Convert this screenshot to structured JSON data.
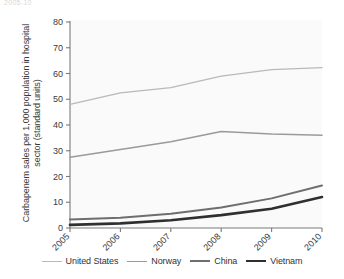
{
  "figure": {
    "top_caption": "2005-10",
    "background_color": "#ffffff",
    "plot_background_color": "#fafafa"
  },
  "chart_data": {
    "type": "line",
    "title": "",
    "subtitle": "",
    "xlabel": "",
    "ylabel": "Carbapenem sales per 1,000 population in hospital sector (standard units)",
    "categories": [
      "2005",
      "2006",
      "2007",
      "2008",
      "2009",
      "2010"
    ],
    "x": [
      2005,
      2006,
      2007,
      2008,
      2009,
      2010
    ],
    "xlim": [
      2005,
      2010
    ],
    "ylim": [
      0,
      80
    ],
    "yticks": [
      0,
      10,
      20,
      30,
      40,
      50,
      60,
      70,
      80
    ],
    "ytick_labels": [
      "0",
      "10",
      "20",
      "30",
      "40",
      "50",
      "60",
      "70",
      "80"
    ],
    "xtick_labels": [
      "2005",
      "2006",
      "2007",
      "2008",
      "2009",
      "2010"
    ],
    "xtick_rotation": -45,
    "grid": false,
    "legend_position": "bottom",
    "series": [
      {
        "name": "United States",
        "values": [
          48.0,
          52.5,
          54.5,
          59.0,
          61.5,
          62.3
        ],
        "color": "#b9b9b9",
        "width": 1.3
      },
      {
        "name": "Norway",
        "values": [
          27.5,
          30.5,
          33.5,
          37.5,
          36.5,
          36.0
        ],
        "color": "#9a9a9a",
        "width": 1.6
      },
      {
        "name": "China",
        "values": [
          3.3,
          4.0,
          5.5,
          8.0,
          11.5,
          16.5
        ],
        "color": "#6e6e6e",
        "width": 2.0
      },
      {
        "name": "Vietnam",
        "values": [
          1.2,
          1.8,
          3.0,
          5.0,
          7.5,
          12.0
        ],
        "color": "#2f2f2f",
        "width": 2.6
      }
    ]
  },
  "axes": {
    "axis_color": "#7a7a7a",
    "tick_color": "#7a7a7a",
    "tick_label_color": "#3a3a3a"
  },
  "legend": {
    "items": [
      {
        "label": "United States",
        "color": "#b9b9b9",
        "width": 1.3
      },
      {
        "label": "Norway",
        "color": "#9a9a9a",
        "width": 1.6
      },
      {
        "label": "China",
        "color": "#6e6e6e",
        "width": 2.0
      },
      {
        "label": "Vietnam",
        "color": "#2f2f2f",
        "width": 2.6
      }
    ]
  }
}
